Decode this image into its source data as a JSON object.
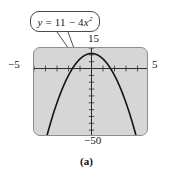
{
  "figure": {
    "caption": "(a)",
    "callout": {
      "lhs": "y",
      "equals": "=",
      "const": "11",
      "minus": "−",
      "coef": "4",
      "var": "x",
      "exp": "2",
      "full_text": "y = 11 − 4x²"
    },
    "labels": {
      "top": "15",
      "left": "−5",
      "right": "5",
      "bottom": "−50"
    },
    "colors": {
      "screen_fill": "#d6d6d6",
      "frame_stroke": "#8d8d8d",
      "curve": "#1a1a1a",
      "axis": "#2b2b2b",
      "callout_border": "#4a4a4a",
      "text": "#151515"
    }
  },
  "chart_data": {
    "type": "line",
    "xlabel": "",
    "ylabel": "",
    "xlim": [
      -5,
      5
    ],
    "ylim": [
      -50,
      15
    ],
    "grid": false,
    "legend": null,
    "x_tick_labels": [
      "−5",
      "5"
    ],
    "y_tick_labels": [
      "15",
      "−50"
    ],
    "x_tick_step": 1,
    "y_tick_step": 5,
    "annotations": [
      "y = 11 − 4x²"
    ],
    "series": [
      {
        "name": "y = 11 - 4x^2",
        "equation": "y = 11 - 4*x^2",
        "x": [
          -5,
          -4.5,
          -4,
          -3.5,
          -3,
          -2.5,
          -2,
          -1.5,
          -1,
          -0.5,
          0,
          0.5,
          1,
          1.5,
          2,
          2.5,
          3,
          3.5,
          4,
          4.5,
          5
        ],
        "y": [
          -89,
          -70,
          -53,
          -38,
          -25,
          -14,
          -5,
          2,
          7,
          10,
          11,
          10,
          7,
          2,
          -5,
          -14,
          -25,
          -38,
          -53,
          -70,
          -89
        ]
      }
    ]
  }
}
